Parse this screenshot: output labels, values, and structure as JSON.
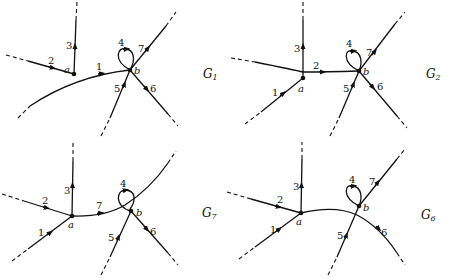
{
  "figure": {
    "panels": [
      {
        "id": "G1",
        "name": "G",
        "subscript": "1",
        "vertices": {
          "a": "a",
          "b": "b"
        },
        "edges": [
          "1",
          "2",
          "3",
          "4",
          "5",
          "6",
          "7"
        ]
      },
      {
        "id": "G2",
        "name": "G",
        "subscript": "2",
        "vertices": {
          "a": "a",
          "b": "b"
        },
        "edges": [
          "1",
          "2",
          "3",
          "4",
          "5",
          "6",
          "7"
        ]
      },
      {
        "id": "G7",
        "name": "G",
        "subscript": "7",
        "vertices": {
          "a": "a",
          "b": "b"
        },
        "edges": [
          "1",
          "2",
          "3",
          "4",
          "5",
          "6",
          "7"
        ]
      },
      {
        "id": "G6",
        "name": "G",
        "subscript": "6",
        "vertices": {
          "a": "a",
          "b": "b"
        },
        "edges": [
          "1",
          "2",
          "3",
          "4",
          "5",
          "6",
          "7"
        ]
      }
    ]
  }
}
